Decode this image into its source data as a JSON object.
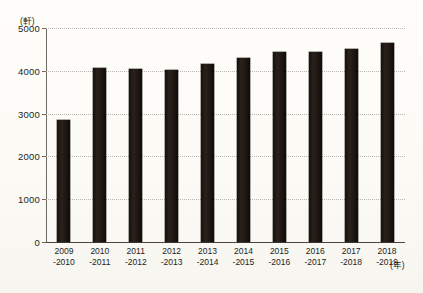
{
  "chart_data": {
    "type": "bar",
    "title": "",
    "xlabel": "(年)",
    "ylabel": "(軒)",
    "categories": [
      "2009\n-2010",
      "2010\n-2011",
      "2011\n-2012",
      "2012\n-2013",
      "2013\n-2014",
      "2014\n-2015",
      "2015\n-2016",
      "2016\n-2017",
      "2017\n-2018",
      "2018\n-2019"
    ],
    "category_lines": [
      {
        "top": "2009",
        "bottom": "-2010"
      },
      {
        "top": "2010",
        "bottom": "-2011"
      },
      {
        "top": "2011",
        "bottom": "-2012"
      },
      {
        "top": "2012",
        "bottom": "-2013"
      },
      {
        "top": "2013",
        "bottom": "-2014"
      },
      {
        "top": "2014",
        "bottom": "-2015"
      },
      {
        "top": "2015",
        "bottom": "-2016"
      },
      {
        "top": "2016",
        "bottom": "-2017"
      },
      {
        "top": "2017",
        "bottom": "-2018"
      },
      {
        "top": "2018",
        "bottom": "-2019"
      }
    ],
    "values": [
      2840,
      4070,
      4050,
      4030,
      4170,
      4300,
      4450,
      4440,
      4500,
      4650
    ],
    "ylim": [
      0,
      5000
    ],
    "yticks": [
      0,
      1000,
      2000,
      3000,
      4000,
      5000
    ],
    "ytick_labels": [
      "0",
      "1000",
      "2000",
      "3000",
      "4000",
      "5000"
    ],
    "grid": true,
    "grid_style": "dotted-horizontal",
    "legend": "none",
    "bar_color": "#1a130e",
    "background_color": "#fdfcf8",
    "gridline_color": "#b9b8b2",
    "axis_color": "#4a463f"
  }
}
